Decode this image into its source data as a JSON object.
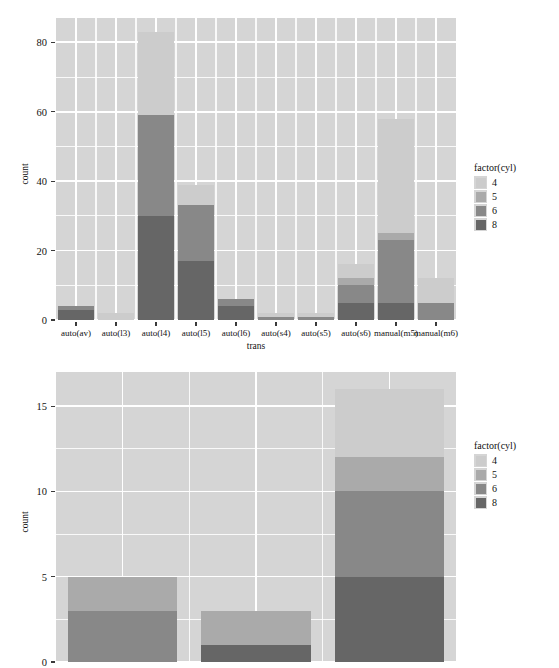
{
  "figure": {
    "background": "#ffffff",
    "panel_background": "#d5d5d5",
    "gridline_color": "#ffffff"
  },
  "palette": {
    "4": "#cccccc",
    "5": "#aaaaaa",
    "6": "#888888",
    "8": "#666666"
  },
  "legend": {
    "title": "factor(cyl)",
    "entries": [
      {
        "label": "4",
        "color": "#cccccc"
      },
      {
        "label": "5",
        "color": "#aaaaaa"
      },
      {
        "label": "6",
        "color": "#888888"
      },
      {
        "label": "8",
        "color": "#666666"
      }
    ]
  },
  "chart_data": [
    {
      "type": "bar",
      "stacked": true,
      "title": "",
      "xlabel": "trans",
      "ylabel": "count",
      "grid": true,
      "legend_position": "right",
      "ylim": [
        0,
        87
      ],
      "yticks": [
        0,
        20,
        40,
        60,
        80
      ],
      "yticklabels": [
        "0",
        "20",
        "40",
        "60",
        "80"
      ],
      "yminor": [
        10,
        30,
        50,
        70
      ],
      "categories": [
        "auto(av)",
        "auto(l3)",
        "auto(l4)",
        "auto(l5)",
        "auto(l6)",
        "auto(s4)",
        "auto(s5)",
        "auto(s6)",
        "manual(m5)",
        "manual(m6)"
      ],
      "series": [
        {
          "name": "4",
          "color": "#cccccc",
          "values": [
            0,
            2,
            24,
            6,
            0,
            1,
            1,
            4,
            33,
            7
          ]
        },
        {
          "name": "5",
          "color": "#aaaaaa",
          "values": [
            0,
            0,
            0,
            0,
            0,
            0,
            0,
            2,
            2,
            0
          ]
        },
        {
          "name": "6",
          "color": "#888888",
          "values": [
            1,
            0,
            29,
            16,
            2,
            1,
            1,
            5,
            18,
            5
          ]
        },
        {
          "name": "8",
          "color": "#666666",
          "values": [
            3,
            0,
            30,
            17,
            4,
            0,
            0,
            5,
            5,
            0
          ]
        }
      ],
      "totals": [
        4,
        2,
        83,
        39,
        6,
        2,
        2,
        16,
        58,
        12
      ]
    },
    {
      "type": "bar",
      "stacked": true,
      "title": "",
      "xlabel": "",
      "ylabel": "count",
      "grid": true,
      "legend_position": "right",
      "ylim": [
        0,
        17
      ],
      "yticks": [
        0,
        5,
        10,
        15
      ],
      "yticklabels": [
        "0",
        "5",
        "10",
        "15"
      ],
      "yminor": [
        2.5,
        7.5,
        12.5
      ],
      "categories": [
        "",
        "",
        ""
      ],
      "series": [
        {
          "name": "4",
          "color": "#cccccc",
          "values": [
            0,
            0,
            4
          ]
        },
        {
          "name": "5",
          "color": "#aaaaaa",
          "values": [
            2,
            2,
            2
          ]
        },
        {
          "name": "6",
          "color": "#888888",
          "values": [
            3,
            0,
            5
          ]
        },
        {
          "name": "8",
          "color": "#666666",
          "values": [
            0,
            1,
            5
          ]
        }
      ],
      "totals": [
        5,
        3,
        16
      ]
    }
  ]
}
